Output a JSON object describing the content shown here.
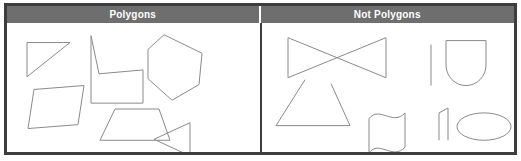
{
  "figure": {
    "width": 521,
    "height": 161,
    "background_color": "#ffffff",
    "frame_color": "#3d3d3d",
    "header_background_color": "#6e6e6e",
    "header_text_color": "#ffffff",
    "shape_stroke_color": "#8a8a8a"
  },
  "columns": [
    {
      "id": "polygons",
      "header": "Polygons",
      "shapes": [
        {
          "name": "right-triangle",
          "label": "right triangle",
          "kind": "polygon",
          "closed": true,
          "curved": false,
          "points": "20,20 63,20 20,55"
        },
        {
          "name": "parallelogram",
          "label": "parallelogram",
          "kind": "polygon",
          "closed": true,
          "curved": false,
          "points": "27,68 77,64 71,104 21,108"
        },
        {
          "name": "concave-chair-polygon",
          "label": "concave chair-shaped polygon",
          "kind": "polygon",
          "closed": true,
          "curved": false,
          "points": "84,13 84,82 136,82 136,48 92,52"
        },
        {
          "name": "trapezoid",
          "label": "trapezoid",
          "kind": "polygon",
          "closed": true,
          "curved": false,
          "points": "108,88 152,88 163,120 93,120"
        },
        {
          "name": "pentagon",
          "label": "pentagon",
          "kind": "polygon",
          "closed": true,
          "curved": false,
          "points": "157,12 195,31 192,63 165,79 141,57 141,27"
        },
        {
          "name": "left-pointing-triangle",
          "label": "left pointing triangle",
          "kind": "polygon",
          "closed": true,
          "curved": false,
          "points": "183,102 183,136 147,119"
        }
      ]
    },
    {
      "id": "not-polygons",
      "header": "Not Polygons",
      "shapes": [
        {
          "name": "bowtie-self-intersecting",
          "label": "self intersecting bowtie",
          "kind": "polygon",
          "closed": true,
          "curved": false,
          "points": "23,15 23,56 121,15 121,56"
        },
        {
          "name": "open-parallelogram",
          "label": "open parallelogram with gap",
          "kind": "polyline",
          "closed": false,
          "curved": false,
          "points": "40,58 11,105 85,105 66,62"
        },
        {
          "name": "wavy-flag",
          "label": "wavy curved figure",
          "kind": "path",
          "closed": true,
          "curved": true,
          "d": "M 104,98 C 114,84 128,106 140,92 L 140,127 C 128,141 114,119 104,133 Z"
        },
        {
          "name": "line-segment",
          "label": "line segment",
          "kind": "line",
          "closed": false,
          "curved": false,
          "points": "166,22 166,64"
        },
        {
          "name": "u-shape-curved",
          "label": "U shape with curved bottom",
          "kind": "path",
          "closed": true,
          "curved": true,
          "d": "M 181,18 L 181,43 A 20 21 0 0 0 221,43 L 221,18 Z"
        },
        {
          "name": "open-quadrilateral",
          "label": "open quadrilateral",
          "kind": "polyline",
          "closed": false,
          "curved": false,
          "points": "183,120 183,87 174,92 174,120"
        },
        {
          "name": "ellipse",
          "label": "ellipse",
          "kind": "ellipse",
          "closed": true,
          "curved": true,
          "cx": 219,
          "cy": 106,
          "rx": 27,
          "ry": 14
        }
      ]
    }
  ]
}
